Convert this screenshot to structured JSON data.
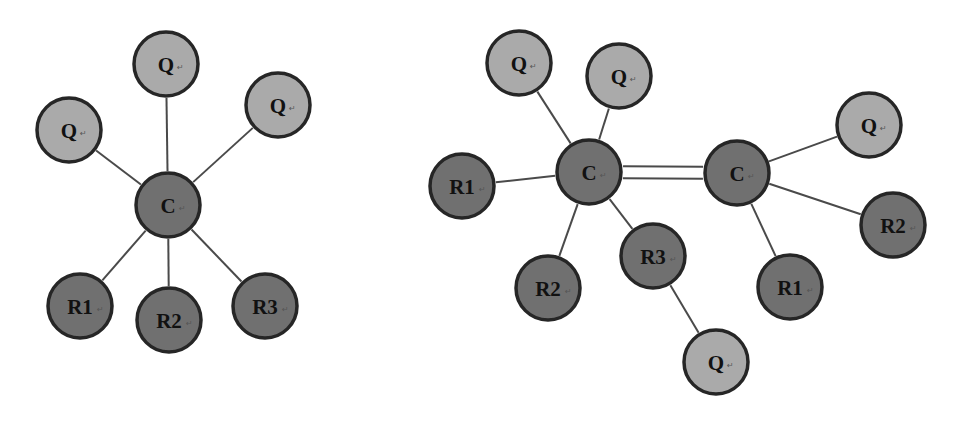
{
  "colors": {
    "light_node": "#aaaaaa",
    "dark_node": "#707070",
    "outline": "#262626",
    "bond": "#4a4a4a",
    "background": "#ffffff"
  },
  "left_diagram": {
    "nodes": [
      {
        "id": "C",
        "label": "C",
        "type": "dark",
        "x": 168,
        "y": 205
      },
      {
        "id": "Q1",
        "label": "Q",
        "type": "light",
        "x": 69,
        "y": 130
      },
      {
        "id": "Q2",
        "label": "Q",
        "type": "light",
        "x": 166,
        "y": 64
      },
      {
        "id": "Q3",
        "label": "Q",
        "type": "light",
        "x": 278,
        "y": 105
      },
      {
        "id": "R1",
        "label": "R1",
        "type": "dark",
        "x": 80,
        "y": 306
      },
      {
        "id": "R2",
        "label": "R2",
        "type": "dark",
        "x": 169,
        "y": 320
      },
      {
        "id": "R3",
        "label": "R3",
        "type": "dark",
        "x": 265,
        "y": 306
      }
    ],
    "bonds": [
      {
        "from": "C",
        "to": "Q1",
        "order": 1
      },
      {
        "from": "C",
        "to": "Q2",
        "order": 1
      },
      {
        "from": "C",
        "to": "Q3",
        "order": 1
      },
      {
        "from": "C",
        "to": "R1",
        "order": 1
      },
      {
        "from": "C",
        "to": "R2",
        "order": 1
      },
      {
        "from": "C",
        "to": "R3",
        "order": 1
      }
    ]
  },
  "right_diagram": {
    "nodes": [
      {
        "id": "C1",
        "label": "C",
        "type": "dark",
        "x": 589,
        "y": 172
      },
      {
        "id": "C2",
        "label": "C",
        "type": "dark",
        "x": 737,
        "y": 173
      },
      {
        "id": "Qa",
        "label": "Q",
        "type": "light",
        "x": 519,
        "y": 63
      },
      {
        "id": "Qb",
        "label": "Q",
        "type": "light",
        "x": 619,
        "y": 76
      },
      {
        "id": "R1a",
        "label": "R1",
        "type": "dark",
        "x": 462,
        "y": 186
      },
      {
        "id": "R2a",
        "label": "R2",
        "type": "dark",
        "x": 548,
        "y": 288
      },
      {
        "id": "R3a",
        "label": "R3",
        "type": "dark",
        "x": 653,
        "y": 256
      },
      {
        "id": "Qc",
        "label": "Q",
        "type": "light",
        "x": 716,
        "y": 362
      },
      {
        "id": "Qd",
        "label": "Q",
        "type": "light",
        "x": 869,
        "y": 125
      },
      {
        "id": "R2b",
        "label": "R2",
        "type": "dark",
        "x": 893,
        "y": 225
      },
      {
        "id": "R1b",
        "label": "R1",
        "type": "dark",
        "x": 790,
        "y": 287
      }
    ],
    "bonds": [
      {
        "from": "C1",
        "to": "C2",
        "order": 2
      },
      {
        "from": "C1",
        "to": "Qa",
        "order": 1
      },
      {
        "from": "C1",
        "to": "Qb",
        "order": 1
      },
      {
        "from": "C1",
        "to": "R1a",
        "order": 1
      },
      {
        "from": "C1",
        "to": "R2a",
        "order": 1
      },
      {
        "from": "C1",
        "to": "R3a",
        "order": 1
      },
      {
        "from": "R3a",
        "to": "Qc",
        "order": 1
      },
      {
        "from": "C2",
        "to": "Qd",
        "order": 1
      },
      {
        "from": "C2",
        "to": "R2b",
        "order": 1
      },
      {
        "from": "C2",
        "to": "R1b",
        "order": 1
      }
    ]
  },
  "node_radius": 32
}
